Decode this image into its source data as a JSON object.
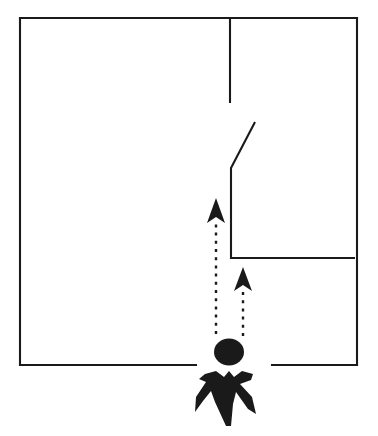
{
  "scene": {
    "title": "Floor plan with observer and two sight lines",
    "background_color": "#ffffff",
    "ink_color": "#1a1a1a",
    "width": 378,
    "height": 436
  },
  "room": {
    "outline_label": "room-outline",
    "top_wall": {
      "x1": 20,
      "y1": 18,
      "x2": 357,
      "y2": 18
    },
    "left_wall": {
      "x1": 20,
      "y1": 18,
      "x2": 20,
      "y2": 365
    },
    "right_wall": {
      "x1": 357,
      "y1": 18,
      "x2": 357,
      "y2": 365
    },
    "bottom_wall_left": {
      "x1": 20,
      "y1": 365,
      "x2": 196,
      "y2": 365
    },
    "bottom_wall_right": {
      "x1": 272,
      "y1": 365,
      "x2": 357,
      "y2": 365
    },
    "doorway_gap": {
      "from_x": 196,
      "to_x": 272,
      "y": 365
    }
  },
  "partitions": [
    {
      "name": "upper-partition-wall",
      "points": "230,18 230,103"
    },
    {
      "name": "angled-partition-wall",
      "points": "255,122 231,168 231,258 355,258"
    }
  ],
  "sight_lines": [
    {
      "name": "left-sight-line",
      "arrow_tip": {
        "x": 216,
        "y": 198
      },
      "arrow_base_y": 222,
      "dash_start_y": 222,
      "dash_end_y": 334,
      "x": 216
    },
    {
      "name": "right-sight-line",
      "arrow_tip": {
        "x": 243,
        "y": 267
      },
      "arrow_base_y": 290,
      "dash_start_y": 290,
      "dash_end_y": 336,
      "x": 243
    }
  ],
  "person": {
    "name": "observer-figure",
    "head": {
      "cx": 229,
      "cy": 352,
      "rx": 15,
      "ry": 13.5
    },
    "body_path": "M 205,374 L 216,371 L 224,377 L 229,371 L 234,377 L 242,371 L 253,374 L 251,380 L 240,384 L 252,397 L 256,414 L 248,409 L 236,392 L 233,404 L 231,426 L 226,426 L 215,402 L 211,391 L 203,401 L 195,412 L 196,397 L 206,382 L 199,379 Z"
  },
  "labels": {
    "diagram_caption": ""
  }
}
